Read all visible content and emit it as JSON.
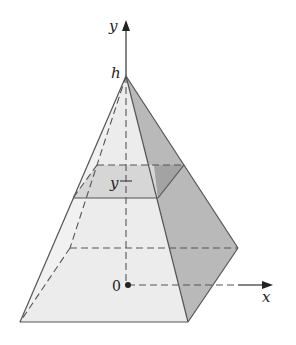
{
  "figure": {
    "labels": {
      "y_axis": "y",
      "x_axis": "x",
      "apex": "h",
      "section": "y",
      "origin": "0"
    },
    "colors": {
      "front_face": "#ececec",
      "right_face": "#b9b9b9",
      "section_front": "#d6d6d6",
      "section_right": "#a3a3a3",
      "stroke": "#555555",
      "axis": "#333333"
    }
  }
}
